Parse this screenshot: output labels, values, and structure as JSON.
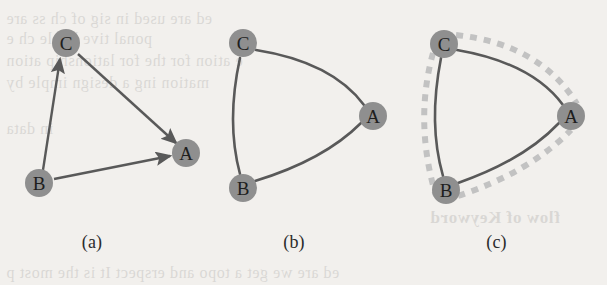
{
  "figure": {
    "background_color": "#f2f0ed",
    "node_fill": "#8f8f8f",
    "node_text_color": "#1e1e1e",
    "edge_color": "#595959",
    "overlay_color": "#bdbdbd",
    "caption_color": "#2b2b2b",
    "panels": [
      {
        "id": "a",
        "caption": "(a)",
        "type": "directed-straight-graph",
        "nodes": [
          {
            "id": "C",
            "label": "C",
            "cx": 66,
            "cy": 43,
            "r": 14
          },
          {
            "id": "A",
            "label": "A",
            "cx": 186,
            "cy": 153,
            "r": 14
          },
          {
            "id": "B",
            "label": "B",
            "cx": 39,
            "cy": 183,
            "r": 14
          }
        ],
        "edges": [
          {
            "from": "B",
            "to": "C",
            "style": "solid",
            "arrow": true
          },
          {
            "from": "C",
            "to": "A",
            "style": "solid",
            "arrow": true
          },
          {
            "from": "B",
            "to": "A",
            "style": "solid",
            "arrow": true
          }
        ]
      },
      {
        "id": "b",
        "caption": "(b)",
        "type": "undirected-curved-graph",
        "nodes": [
          {
            "id": "C",
            "label": "C",
            "cx": 43,
            "cy": 43,
            "r": 14
          },
          {
            "id": "A",
            "label": "A",
            "cx": 173,
            "cy": 116,
            "r": 14
          },
          {
            "id": "B",
            "label": "B",
            "cx": 43,
            "cy": 188,
            "r": 14
          }
        ],
        "edges": [
          {
            "from": "C",
            "to": "A",
            "style": "solid",
            "arrow": false,
            "curve": "inward"
          },
          {
            "from": "C",
            "to": "B",
            "style": "solid",
            "arrow": false,
            "curve": "inward"
          },
          {
            "from": "B",
            "to": "A",
            "style": "solid",
            "arrow": false,
            "curve": "inward"
          }
        ]
      },
      {
        "id": "c",
        "caption": "(c)",
        "type": "curved-graph-with-dashed-overlay",
        "nodes": [
          {
            "id": "C",
            "label": "C",
            "cx": 44,
            "cy": 44,
            "r": 14
          },
          {
            "id": "A",
            "label": "A",
            "cx": 171,
            "cy": 116,
            "r": 14
          },
          {
            "id": "B",
            "label": "B",
            "cx": 46,
            "cy": 190,
            "r": 14
          }
        ],
        "edges": [
          {
            "from": "C",
            "to": "A",
            "style": "solid",
            "arrow": false,
            "curve": "inward"
          },
          {
            "from": "C",
            "to": "B",
            "style": "solid",
            "arrow": false,
            "curve": "inward"
          },
          {
            "from": "B",
            "to": "A",
            "style": "solid",
            "arrow": false,
            "curve": "inward"
          }
        ],
        "overlay_edges": [
          {
            "from": "C",
            "to": "A",
            "style": "dashed",
            "curve": "outward"
          },
          {
            "from": "C",
            "to": "B",
            "style": "dashed",
            "curve": "outward"
          },
          {
            "from": "B",
            "to": "A",
            "style": "dashed",
            "curve": "outward"
          }
        ]
      }
    ]
  },
  "ghost_text": {
    "note": "faint show-through text from the reverse side of the scanned page",
    "lines": [
      "ed are  used in sig  of ch  ss  are",
      "ponal  tive  hat  le  ch  e",
      "e  ation  for the  for  lationship  ation",
      "mation  ing  a  design  imple  by",
      "in data",
      "flow of Keyword",
      "ed are  we get a topo  and  erspect  It is the  most  p"
    ]
  }
}
